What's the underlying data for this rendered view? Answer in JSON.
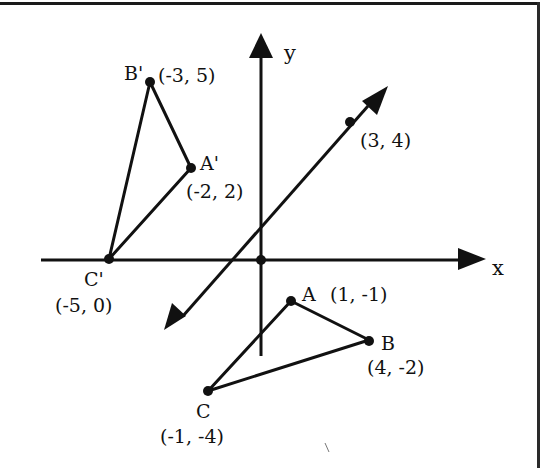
{
  "diagram": {
    "type": "coordinate-plane-reflection",
    "axes": {
      "x_label": "x",
      "y_label": "y"
    },
    "line_of_reflection": {
      "marked_point_label": "(3, 4)",
      "description": "line y = x with arrows both ends"
    },
    "triangle_original": {
      "points": [
        {
          "name": "A",
          "label": "A",
          "coords": "(1, -1)"
        },
        {
          "name": "B",
          "label": "B",
          "coords": "(4, -2)"
        },
        {
          "name": "C",
          "label": "C",
          "coords": "(-1, -4)"
        }
      ]
    },
    "triangle_image": {
      "points": [
        {
          "name": "A'",
          "label": "A'",
          "coords": "(-2, 2)"
        },
        {
          "name": "B'",
          "label": "B'",
          "coords": "(-3, 5)"
        },
        {
          "name": "C'",
          "label": "C'",
          "coords": "(-5, 0)"
        }
      ]
    },
    "colors": {
      "ink": "#111111",
      "background": "#ffffff"
    }
  }
}
